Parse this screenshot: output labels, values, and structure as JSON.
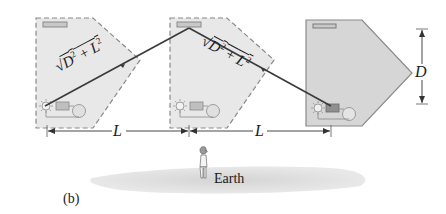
{
  "figure": {
    "panel_label": "(b)",
    "earth_label": "Earth",
    "path_label_left": "√(D² + L²)",
    "path_label_right": "√(D² + L²)",
    "dimension_L_left": "L",
    "dimension_L_right": "L",
    "dimension_D": "D",
    "sqrt_symbol": "√",
    "D_base": "D",
    "L_base": "L",
    "exponent": "2",
    "plus": "+"
  },
  "colors": {
    "panel_fill_dashed": "#e6e6e6",
    "panel_fill_solid": "#d6d6d6",
    "panel_stroke": "#8a8a8a",
    "light_path": "#3a3a3a",
    "mirror_fill": "#c8c8c8",
    "detector_fill": "#9a9a9a",
    "earth_fill": "#dcdcdc",
    "text": "#1a1a1a"
  },
  "clocks": [
    {
      "name": "clock-position-1",
      "style": "dashed"
    },
    {
      "name": "clock-position-2",
      "style": "dashed"
    },
    {
      "name": "clock-position-3",
      "style": "solid"
    }
  ]
}
